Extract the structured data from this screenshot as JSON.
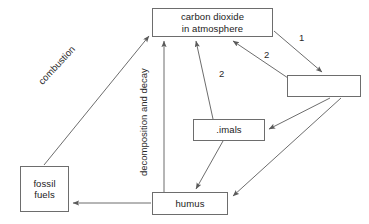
{
  "diagram": {
    "background_color": "#ffffff",
    "line_color": "#6d6d6d",
    "text_color": "#1a1a1a",
    "nodes": [
      {
        "id": "co2",
        "label": "carbon dioxide\nin atmosphere"
      },
      {
        "id": "blank",
        "label": ""
      },
      {
        "id": "animals",
        "label": ".imals"
      },
      {
        "id": "fossil",
        "label": "fossil\nfuels"
      },
      {
        "id": "humus",
        "label": "humus"
      }
    ],
    "edge_labels": {
      "one": "1",
      "two_right": "2",
      "two_middle": "2",
      "combustion": "combustion",
      "decomposition": "decomposition and decay"
    },
    "edges": [
      {
        "from": "co2",
        "to": "blank",
        "label": "1"
      },
      {
        "from": "blank",
        "to": "co2",
        "label": "2"
      },
      {
        "from": "animals",
        "to": "co2",
        "label": "2"
      },
      {
        "from": "humus",
        "to": "co2",
        "label": "decomposition and decay"
      },
      {
        "from": "fossil",
        "to": "co2",
        "label": "combustion"
      },
      {
        "from": "blank",
        "to": "animals",
        "label": ""
      },
      {
        "from": "blank",
        "to": "humus",
        "label": ""
      },
      {
        "from": "animals",
        "to": "humus",
        "label": ""
      },
      {
        "from": "humus",
        "to": "fossil",
        "label": ""
      }
    ]
  }
}
